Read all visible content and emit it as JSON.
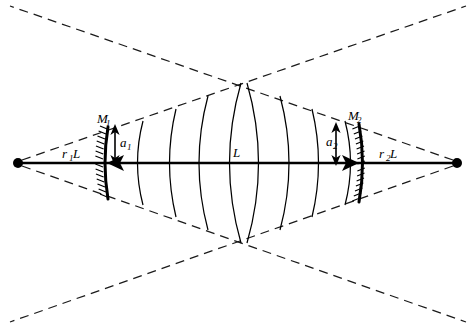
{
  "figure": {
    "background_color": "#ffffff",
    "line_color": "#000000",
    "width": 476,
    "height": 330
  },
  "labels": {
    "mirror_left": "M",
    "mirror_left_sub": "1",
    "mirror_right": "M",
    "mirror_right_sub": "2",
    "beam_radius_left": "a",
    "beam_radius_left_sub": "1",
    "beam_radius_right": "a",
    "beam_radius_right_sub": "2",
    "cavity_length": "L",
    "left_distance": "r",
    "left_distance_sub": "1",
    "left_distance_unit": "L",
    "right_distance": "r",
    "right_distance_sub": "2",
    "right_distance_unit": "L"
  },
  "geometry": {
    "axis_y": 163,
    "left_apex_x": 18,
    "right_apex_x": 457,
    "mirror_left_x": 106,
    "mirror_right_x": 360,
    "cone_cross_top_x": 243,
    "cone_cross_top_y": 95,
    "cone_cross_bottom_y": 231,
    "mirror_left_half_height": 36,
    "mirror_right_half_height": 39,
    "apex_dot_radius": 5
  },
  "wavefronts": {
    "count": 6,
    "positions_x": [
      139,
      171,
      199,
      230,
      262,
      294,
      326
    ],
    "description": "Curved phase fronts bowing away from the cavity centre"
  },
  "annotations": {
    "arrow_left_label": "a1 arrow marks beam radius at mirror M1",
    "arrow_right_label": "a2 arrow marks beam radius at mirror M2",
    "axis_label": "L denotes mirror separation along the optical axis"
  }
}
